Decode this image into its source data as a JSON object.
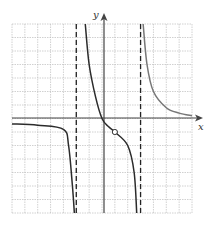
{
  "chart_data": {
    "type": "line",
    "title": "",
    "xlabel": "x",
    "ylabel": "y",
    "grid": true,
    "xlim": [
      -7,
      7
    ],
    "ylim": [
      -7,
      7
    ],
    "vertical_asymptotes": [
      -2,
      3
    ],
    "horizontal_asymptote": 0,
    "holes": [
      {
        "x": 1,
        "y": -1
      }
    ],
    "series": [
      {
        "name": "left-branch",
        "points": [
          [
            -7,
            -0.4
          ],
          [
            -5,
            -0.5
          ],
          [
            -3,
            -0.8
          ],
          [
            -2.6,
            -2
          ],
          [
            -2.3,
            -5
          ],
          [
            -2.15,
            -7
          ]
        ]
      },
      {
        "name": "middle-branch",
        "points": [
          [
            -1.3,
            7
          ],
          [
            -1,
            4
          ],
          [
            -0.5,
            1.6
          ],
          [
            0,
            0
          ],
          [
            0.5,
            -0.6
          ],
          [
            1,
            -1
          ],
          [
            2,
            -2
          ],
          [
            2.5,
            -4
          ],
          [
            2.7,
            -7
          ]
        ]
      },
      {
        "name": "right-branch",
        "points": [
          [
            3.2,
            7
          ],
          [
            3.5,
            4
          ],
          [
            4,
            2
          ],
          [
            5,
            0.8
          ],
          [
            6,
            0.4
          ],
          [
            7,
            0.2
          ]
        ]
      }
    ]
  },
  "labels": {
    "x_axis": "x",
    "y_axis": "y"
  },
  "colors": {
    "curve": "#2b2b2b",
    "right_curve": "#777777",
    "grid": "#bdbdbd",
    "axis": "#444444"
  }
}
